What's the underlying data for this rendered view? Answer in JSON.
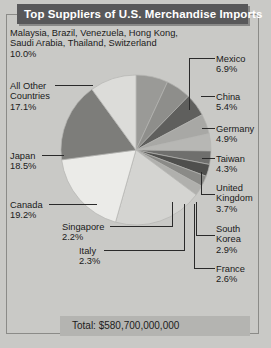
{
  "title": "Top Suppliers of U.S. Merchandise Imports",
  "total_label": "Total: $580,700,000,000",
  "colors": {
    "background": "#c9c9c6",
    "titlebar": "#58585a",
    "title_text": "#ffffff",
    "leader_line": "#2a2a2a"
  },
  "labels": {
    "other_group": {
      "line1": "Malaysia, Brazil, Venezuela, Hong Kong,",
      "line2": "Saudi Arabia, Thailand, Switzerland",
      "pct": "10.0%"
    },
    "all_other": {
      "line1": "All Other",
      "line2": "Countries",
      "pct": "17.1%"
    },
    "japan": {
      "name": "Japan",
      "pct": "18.5%"
    },
    "canada": {
      "name": "Canada",
      "pct": "19.2%"
    },
    "singapore": {
      "name": "Singapore",
      "pct": "2.2%"
    },
    "italy": {
      "name": "Italy",
      "pct": "2.3%"
    },
    "mexico": {
      "name": "Mexico",
      "pct": "6.9%"
    },
    "china": {
      "name": "China",
      "pct": "5.4%"
    },
    "germany": {
      "name": "Germany",
      "pct": "4.9%"
    },
    "taiwan": {
      "name": "Taiwan",
      "pct": "4.3%"
    },
    "uk": {
      "line1": "United",
      "line2": "Kingdom",
      "pct": "3.7%"
    },
    "korea": {
      "line1": "South",
      "line2": "Korea",
      "pct": "2.9%"
    },
    "france": {
      "name": "France",
      "pct": "2.6%"
    }
  },
  "chart_data": {
    "type": "pie",
    "title": "Top Suppliers of U.S. Merchandise Imports",
    "subtitle": "",
    "xlabel": "",
    "ylabel": "",
    "units": "percent of total U.S. merchandise imports",
    "total": "$580,700,000,000",
    "total_value": 580700000000,
    "legend": "callout labels with leader lines",
    "start_angle_deg": 0,
    "direction": "clockwise",
    "center": [
      136,
      150
    ],
    "radius": 75,
    "categories": [
      "Mexico",
      "China",
      "Germany",
      "Taiwan",
      "United Kingdom",
      "South Korea",
      "France",
      "Italy",
      "Singapore",
      "Canada",
      "Japan",
      "All Other Countries",
      "Malaysia, Brazil, Venezuela, Hong Kong, Saudi Arabia, Thailand, Switzerland"
    ],
    "values": [
      6.9,
      5.4,
      4.9,
      4.3,
      3.7,
      2.9,
      2.6,
      2.3,
      2.2,
      19.2,
      18.5,
      17.1,
      10.0
    ],
    "slice_colors": [
      "#9a9a97",
      "#8e8e8b",
      "#5f5f5d",
      "#a8a8a5",
      "#b7b7b4",
      "#6f6f6d",
      "#4f4f4d",
      "#8a8a87",
      "#b0b0ad",
      "#d4d4d1",
      "#ebebe8",
      "#7d7d7a",
      "#dcdcd9"
    ],
    "slices": [
      {
        "label": "Mexico",
        "value": 6.9
      },
      {
        "label": "China",
        "value": 5.4
      },
      {
        "label": "Germany",
        "value": 4.9
      },
      {
        "label": "Taiwan",
        "value": 4.3
      },
      {
        "label": "United Kingdom",
        "value": 3.7
      },
      {
        "label": "South Korea",
        "value": 2.9
      },
      {
        "label": "France",
        "value": 2.6
      },
      {
        "label": "Italy",
        "value": 2.3
      },
      {
        "label": "Singapore",
        "value": 2.2
      },
      {
        "label": "Canada",
        "value": 19.2
      },
      {
        "label": "Japan",
        "value": 18.5
      },
      {
        "label": "All Other Countries",
        "value": 17.1
      },
      {
        "label": "Malaysia, Brazil, Venezuela, Hong Kong, Saudi Arabia, Thailand, Switzerland",
        "value": 10.0
      }
    ]
  }
}
